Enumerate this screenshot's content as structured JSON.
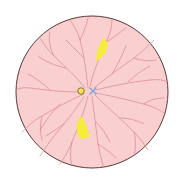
{
  "diagram": {
    "type": "retinal-fundus",
    "background": "#ffffff",
    "fundus": {
      "cx": 92,
      "cy": 92,
      "r": 76,
      "fill": "#f9cfd0",
      "stroke": "#5a3a3a"
    },
    "vessel_color": "#d9878f",
    "optic_disc_marker": {
      "cx": 81,
      "cy": 91,
      "r": 3.2,
      "fill": "#f7e35a",
      "stroke": "#6b5a1a"
    },
    "fovea_marker": {
      "cx": 93,
      "cy": 91,
      "size": 3,
      "color": "#7f9bd8"
    },
    "lesions": [
      {
        "label": "yellow-lesion-upper",
        "fill": "#f5ec3c",
        "points": "104,37 108,44 106,52 99,60 96,61 97,52 100,44"
      },
      {
        "label": "yellow-lesion-lower",
        "fill": "#f5ec3c",
        "points": "80,116 84,120 87,128 90,136 86,138 80,139 77,132 77,124"
      }
    ]
  }
}
